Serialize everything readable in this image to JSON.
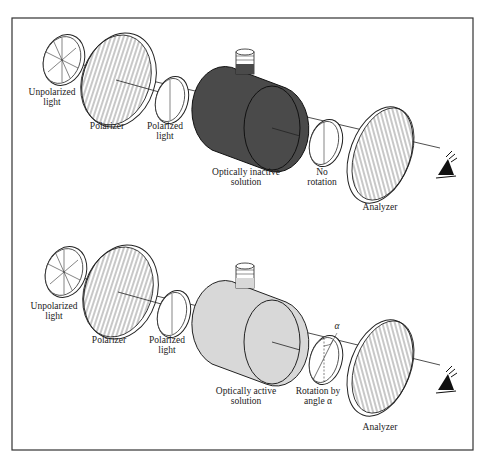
{
  "diagram": {
    "colors": {
      "frame": "#333333",
      "inactive_solution": "#4a4a4a",
      "active_solution": "#d8d8d8",
      "ink": "#222222"
    },
    "panels": [
      {
        "id": "top",
        "labels": {
          "unpolarized": "Unpolarized\nlight",
          "polarizer": "Polarizer",
          "polarized": "Polarized\nlight",
          "solution": "Optically inactive\nsolution",
          "rotation": "No\nrotation",
          "analyzer": "Analyzer"
        }
      },
      {
        "id": "bottom",
        "labels": {
          "unpolarized": "Unpolarized\nlight",
          "polarizer": "Polarizer",
          "polarized": "Polarized\nlight",
          "solution": "Optically active\nsolution",
          "rotation": "Rotation by\nangle α",
          "analyzer": "Analyzer",
          "angle_symbol": "α"
        }
      }
    ],
    "icons": [
      "eye-icon",
      "eye-icon"
    ]
  }
}
